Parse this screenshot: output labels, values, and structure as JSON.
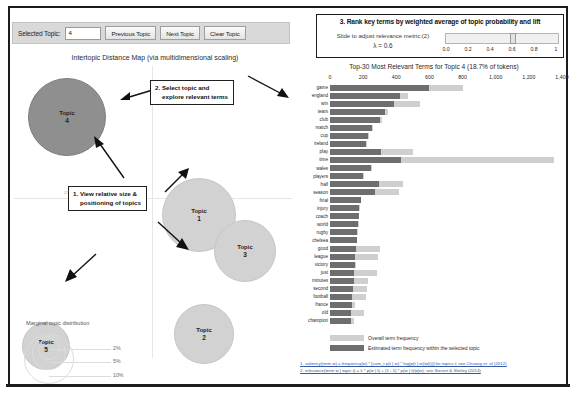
{
  "controls": {
    "selected_topic_label": "Selected Topic:",
    "selected_topic_value": "4",
    "previous_topic": "Previous Topic",
    "next_topic": "Next Topic",
    "clear_topic": "Clear Topic"
  },
  "lambda_panel": {
    "title": "3.  Rank key terms by weighted average of topic probability and lift",
    "slider_label": "Slide to adjust relevance metric:(2)",
    "lambda_value": "λ = 0.6",
    "ticks": [
      "0.0",
      "0.2",
      "0.4",
      "0.6",
      "0.8",
      "1"
    ],
    "current": 0.6
  },
  "left_panel": {
    "title": "Intertopic Distance Map (via multidimensional scaling)",
    "pc_label": "PC1",
    "marginal_title": "Marginal topic distribution",
    "marginal_percents": [
      "2%",
      "5%",
      "10%"
    ],
    "callout_1": [
      "1.  View relative size &",
      "positioning of topics"
    ],
    "callout_2": [
      "2.  Select topic and",
      "explore relevant terms"
    ],
    "topic_word": "Topic",
    "bubbles": [
      {
        "name": "topic-bubble-4",
        "number": "4",
        "x": 14,
        "y": 12,
        "d": 78,
        "selected": true
      },
      {
        "name": "topic-bubble-1",
        "number": "1",
        "x": 148,
        "y": 112,
        "d": 74,
        "selected": false
      },
      {
        "name": "topic-bubble-3",
        "number": "3",
        "x": 200,
        "y": 154,
        "d": 62,
        "selected": false
      },
      {
        "name": "topic-bubble-2",
        "number": "2",
        "x": 160,
        "y": 238,
        "d": 60,
        "selected": false
      },
      {
        "name": "topic-bubble-5",
        "number": "5",
        "x": 8,
        "y": 256,
        "d": 48,
        "selected": false
      }
    ]
  },
  "legend": {
    "overall": "Overall term frequency",
    "topic": "Estimated term frequency within the selected topic"
  },
  "footnotes": [
    "1. saliency(term w) = frequency(w) * [sum_t p(t | w) * log(p(t | w)/p(t))] for topics t; see Chuang et. al (2012)",
    "2. relevance(term w | topic t) = λ * p(w | t) + (1 - λ) * p(w | t)/p(w); see Sievert & Shirley (2014)"
  ],
  "chart_data": {
    "type": "bar",
    "title": "Top-30 Most Relevant Terms for Topic 4 (18.7% of tokens)",
    "xlabel": "",
    "ylabel": "",
    "xlim": [
      0,
      1400
    ],
    "tick_labels": [
      "0",
      "200",
      "400",
      "600",
      "800",
      "1,000",
      "1,200",
      "1,400"
    ],
    "tick_values": [
      0,
      200,
      400,
      600,
      800,
      1000,
      1200,
      1400
    ],
    "grid": false,
    "legend_position": "bottom",
    "categories": [
      "game",
      "england",
      "win",
      "team",
      "club",
      "match",
      "cup",
      "ireland",
      "play",
      "time",
      "wales",
      "players",
      "half",
      "season",
      "final",
      "injury",
      "coach",
      "world",
      "rugby",
      "chelsea",
      "good",
      "league",
      "victory",
      "just",
      "minutes",
      "second",
      "football",
      "france",
      "old",
      "champion"
    ],
    "series": [
      {
        "name": "Overall term frequency",
        "color": "#cfcfcf",
        "values": [
          800,
          470,
          545,
          350,
          315,
          260,
          235,
          225,
          500,
          1350,
          255,
          205,
          440,
          415,
          190,
          180,
          175,
          172,
          168,
          165,
          300,
          290,
          158,
          285,
          230,
          225,
          215,
          150,
          205,
          145
        ]
      },
      {
        "name": "Estimated term frequency within the selected topic",
        "color": "#6e6e6e",
        "values": [
          600,
          425,
          385,
          330,
          300,
          255,
          230,
          220,
          310,
          430,
          245,
          200,
          295,
          270,
          188,
          178,
          172,
          168,
          164,
          160,
          155,
          150,
          148,
          145,
          142,
          138,
          135,
          132,
          128,
          124
        ]
      }
    ]
  }
}
